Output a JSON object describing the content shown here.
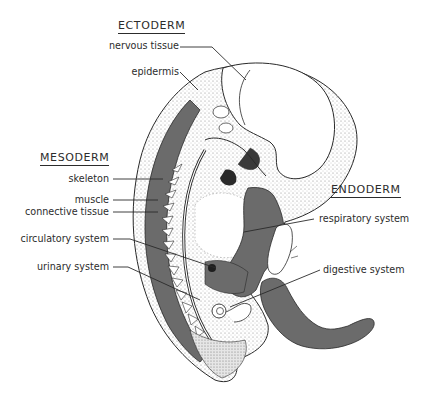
{
  "diagram": {
    "type": "labeled anatomical illustration",
    "colors": {
      "mesoderm_fill": "#6b6b6b",
      "endoderm_fill": "#6b6b6b",
      "ectoderm_fill": "#ffffff",
      "outline": "#2a2a2a",
      "stipple": "#9a9a9a"
    }
  },
  "groups": {
    "ectoderm": {
      "heading": "ECTODERM",
      "labels": [
        "nervous tissue",
        "epidermis"
      ]
    },
    "mesoderm": {
      "heading": "MESODERM",
      "labels": [
        "skeleton",
        "muscle",
        "connective tissue",
        "circulatory system",
        "urinary system"
      ]
    },
    "endoderm": {
      "heading": "ENDODERM",
      "labels": [
        "respiratory system",
        "digestive system"
      ]
    }
  }
}
